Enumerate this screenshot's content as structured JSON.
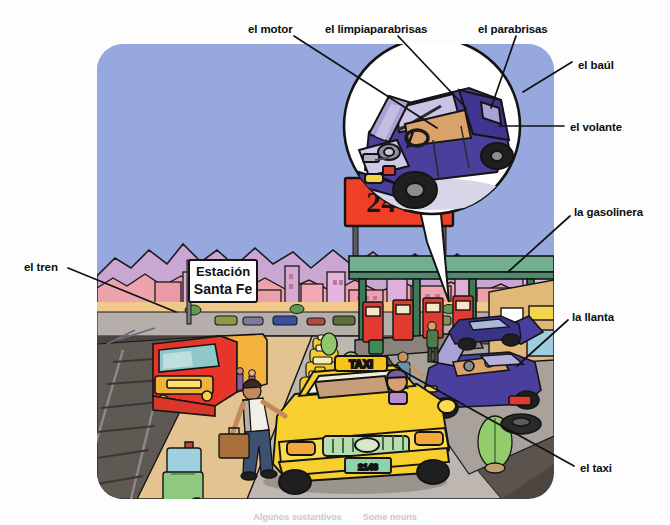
{
  "page": {
    "caption_left": "Algunos sustantivos",
    "caption_sep": "·",
    "caption_right": "Some nouns"
  },
  "labels": [
    {
      "id": "el-motor",
      "text": "el motor",
      "x": 248,
      "y": 24,
      "align": "left",
      "target_x": 437,
      "target_y": 128
    },
    {
      "id": "el-limpiaparabrisas",
      "text": "el limpiaparabrisas",
      "x": 325,
      "y": 24,
      "align": "left",
      "target_x": 466,
      "target_y": 108
    },
    {
      "id": "el-parabrisas",
      "text": "el parabrisas",
      "x": 478,
      "y": 24,
      "align": "left",
      "target_x": 491,
      "target_y": 108
    },
    {
      "id": "el-baul",
      "text": "el baúl",
      "x": 578,
      "y": 60,
      "align": "left",
      "target_x": 523,
      "target_y": 90
    },
    {
      "id": "el-volante",
      "text": "el volante",
      "x": 570,
      "y": 122,
      "align": "left",
      "target_x": 497,
      "target_y": 126
    },
    {
      "id": "la-gasolinera",
      "text": "la gasolinera",
      "x": 574,
      "y": 207,
      "align": "left",
      "target_x": 512,
      "target_y": 268
    },
    {
      "id": "la-llanta",
      "text": "la llanta",
      "x": 572,
      "y": 312,
      "align": "left",
      "target_x": 516,
      "target_y": 366
    },
    {
      "id": "el-taxi",
      "text": "el taxi",
      "x": 580,
      "y": 463,
      "align": "left",
      "target_x": 394,
      "target_y": 366
    },
    {
      "id": "el-tren",
      "text": "el tren",
      "x": 24,
      "y": 262,
      "align": "left",
      "target_x": 176,
      "target_y": 312
    }
  ],
  "scene": {
    "signs": [
      {
        "id": "sign-24hs",
        "text": "24 hs",
        "color_bg": "#ef3f27",
        "color_text": "#1a1a1a"
      },
      {
        "id": "sign-station",
        "line1": "Estación",
        "line2": "Santa Fe",
        "color_bg": "#ffffff",
        "color_text": "#111111"
      },
      {
        "id": "taxi-roof-sign",
        "text": "TAXI",
        "color_bg": "#f5c518",
        "color_text": "#2a2a2a"
      },
      {
        "id": "taxi-plate",
        "text": "2143",
        "color_bg": "#8fd4a8",
        "color_text": "#1d4d2a"
      }
    ],
    "colors": {
      "sky": "#97a8de",
      "mountains_far": "#c8a6d0",
      "mountains_near": "#e9a0a8",
      "ground_sand": "#f0c98a",
      "road_asphalt": "#b7b1ad",
      "rail_bed": "#5c5550",
      "platform": "#e2c190",
      "taxi_yellow": "#f7cf2e",
      "train_red": "#e8352a",
      "car_purple": "#4b3f9e",
      "pump_red": "#e03b2e",
      "canopy_green": "#6aa98c",
      "tree_green": "#8fc96b",
      "city_pink": "#f09aa6",
      "sidewalk": "#cfc7bf",
      "outline": "#141414"
    },
    "objects": [
      "tren",
      "estacion-sign",
      "andén",
      "pasajero-con-maleta",
      "carrito-de-equipaje",
      "fila-de-taxis",
      "taxi-principal",
      "conductor",
      "gasolinera",
      "surtidores",
      "marquesina",
      "auto-averiado",
      "capo-abierto",
      "llanta-de-repuesto",
      "arbustos",
      "edificios",
      "montanas",
      "cartel-24hs",
      "lupa-detalle-auto"
    ]
  },
  "inset": {
    "id": "magnifier-detail",
    "description": "Detalle ampliado de un automóvil morado con el capó abierto",
    "parts": [
      "el motor",
      "el limpiaparabrisas",
      "el parabrisas",
      "el baúl",
      "el volante"
    ]
  }
}
